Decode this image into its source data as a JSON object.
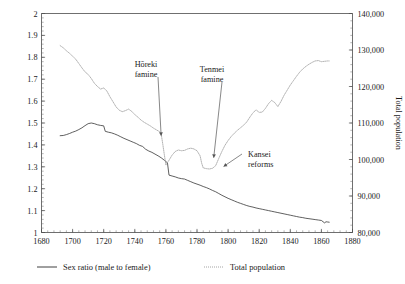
{
  "chart_data": {
    "type": "line",
    "title": "",
    "xlabel": "",
    "ylabel": "",
    "ylabel_right": "Total population",
    "grid": false,
    "legend_position": "bottom",
    "xlim": [
      1680,
      1880
    ],
    "xticks": [
      "1680",
      "1700",
      "1720",
      "1740",
      "1760",
      "1780",
      "1800",
      "1820",
      "1840",
      "1860",
      "1880"
    ],
    "xtick_values": [
      1680,
      1700,
      1720,
      1740,
      1760,
      1780,
      1800,
      1820,
      1840,
      1860,
      1880
    ],
    "ylim_left": [
      1,
      2
    ],
    "yticks_left": [
      "1",
      "1.1",
      "1.2",
      "1.3",
      "1.4",
      "1.5",
      "1.6",
      "1.7",
      "1.8",
      "1.9",
      "2"
    ],
    "ytick_values_left": [
      1,
      1.1,
      1.2,
      1.3,
      1.4,
      1.5,
      1.6,
      1.7,
      1.8,
      1.9,
      2
    ],
    "ylim_right": [
      80000,
      140000
    ],
    "yticks_right": [
      "80,000",
      "90,000",
      "100,000",
      "110,000",
      "120,000",
      "130,000",
      "140,000"
    ],
    "ytick_values_right": [
      80000,
      90000,
      100000,
      110000,
      120000,
      130000,
      140000
    ],
    "series": [
      {
        "name": "Sex ratio (male to female)",
        "axis": "left",
        "style": "solid",
        "color": "#2b2b2b",
        "x": [
          1692,
          1694,
          1696,
          1698,
          1700,
          1702,
          1704,
          1706,
          1708,
          1710,
          1712,
          1714,
          1716,
          1718,
          1720,
          1721,
          1723,
          1725,
          1727,
          1729,
          1731,
          1733,
          1735,
          1737,
          1739,
          1741,
          1743,
          1745,
          1747,
          1749,
          1751,
          1753,
          1755,
          1757,
          1759,
          1761,
          1762,
          1764,
          1766,
          1768,
          1770,
          1772,
          1774,
          1776,
          1778,
          1780,
          1782,
          1784,
          1786,
          1788,
          1790,
          1792,
          1794,
          1796,
          1798,
          1800,
          1802,
          1804,
          1806,
          1808,
          1810,
          1812,
          1814,
          1816,
          1818,
          1820,
          1822,
          1824,
          1826,
          1828,
          1830,
          1832,
          1834,
          1836,
          1838,
          1840,
          1842,
          1844,
          1846,
          1848,
          1850,
          1852,
          1854,
          1856,
          1858,
          1860,
          1862,
          1863,
          1864,
          1865
        ],
        "values": [
          1.442,
          1.443,
          1.447,
          1.452,
          1.458,
          1.463,
          1.47,
          1.478,
          1.488,
          1.497,
          1.5,
          1.497,
          1.492,
          1.489,
          1.487,
          1.462,
          1.458,
          1.455,
          1.45,
          1.444,
          1.437,
          1.43,
          1.424,
          1.418,
          1.412,
          1.406,
          1.398,
          1.393,
          1.38,
          1.372,
          1.366,
          1.358,
          1.35,
          1.341,
          1.33,
          1.318,
          1.262,
          1.258,
          1.254,
          1.249,
          1.246,
          1.244,
          1.238,
          1.232,
          1.226,
          1.221,
          1.216,
          1.21,
          1.205,
          1.199,
          1.192,
          1.186,
          1.178,
          1.17,
          1.163,
          1.156,
          1.15,
          1.144,
          1.138,
          1.133,
          1.128,
          1.123,
          1.119,
          1.116,
          1.112,
          1.109,
          1.106,
          1.103,
          1.1,
          1.097,
          1.094,
          1.091,
          1.088,
          1.085,
          1.082,
          1.079,
          1.076,
          1.073,
          1.07,
          1.068,
          1.065,
          1.063,
          1.061,
          1.059,
          1.057,
          1.055,
          1.044,
          1.049,
          1.048,
          1.047
        ]
      },
      {
        "name": "Total population",
        "axis": "right",
        "style": "dotted",
        "color": "#9a9a9a",
        "x": [
          1692,
          1694,
          1696,
          1698,
          1700,
          1702,
          1704,
          1706,
          1708,
          1710,
          1712,
          1714,
          1716,
          1718,
          1720,
          1722,
          1724,
          1726,
          1728,
          1730,
          1732,
          1734,
          1736,
          1738,
          1740,
          1742,
          1744,
          1746,
          1748,
          1750,
          1752,
          1754,
          1756,
          1757,
          1758,
          1759,
          1760,
          1762,
          1764,
          1766,
          1768,
          1770,
          1772,
          1774,
          1776,
          1778,
          1780,
          1782,
          1783,
          1784,
          1786,
          1788,
          1790,
          1792,
          1794,
          1796,
          1798,
          1800,
          1802,
          1804,
          1806,
          1808,
          1810,
          1812,
          1814,
          1816,
          1818,
          1820,
          1822,
          1824,
          1826,
          1828,
          1830,
          1832,
          1834,
          1836,
          1838,
          1840,
          1842,
          1844,
          1846,
          1848,
          1850,
          1852,
          1854,
          1856,
          1858,
          1860,
          1862,
          1864,
          1865
        ],
        "values": [
          131200,
          130600,
          129800,
          129100,
          128300,
          127500,
          126300,
          125100,
          124000,
          123300,
          122200,
          120900,
          120000,
          119300,
          119600,
          118800,
          117200,
          115800,
          114400,
          113500,
          113100,
          113400,
          113800,
          113200,
          112300,
          111600,
          110800,
          110200,
          109700,
          109200,
          108600,
          108100,
          107600,
          106900,
          104200,
          101300,
          98500,
          99800,
          101200,
          102200,
          102600,
          102400,
          102500,
          102900,
          103100,
          102900,
          102400,
          101000,
          99000,
          97700,
          97500,
          97400,
          97600,
          98300,
          100300,
          102200,
          103900,
          105200,
          106300,
          107200,
          108000,
          108700,
          109400,
          110300,
          111600,
          112800,
          113600,
          112900,
          113000,
          114000,
          115300,
          116200,
          115600,
          114500,
          115900,
          117600,
          119000,
          120400,
          121600,
          122800,
          123900,
          124800,
          125500,
          126100,
          126600,
          127000,
          127100,
          126800,
          126900,
          127000,
          127000
        ]
      }
    ],
    "annotations": [
      {
        "id": "horeki",
        "label_line1": "Hōreki",
        "label_line2": "famine",
        "target_x": 1757,
        "target_y": 106900
      },
      {
        "id": "tenmei",
        "label_line1": "Tenmei",
        "label_line2": "famine",
        "target_x": 1790,
        "target_y": 97600
      },
      {
        "id": "kansei",
        "label_line1": "Kansei",
        "label_line2": "reforms",
        "target_x": 1795,
        "target_y": 98400
      }
    ]
  },
  "legend": {
    "items": [
      {
        "label": "Sex ratio (male to female)",
        "style": "solid"
      },
      {
        "label": "Total population",
        "style": "dotted"
      }
    ]
  }
}
